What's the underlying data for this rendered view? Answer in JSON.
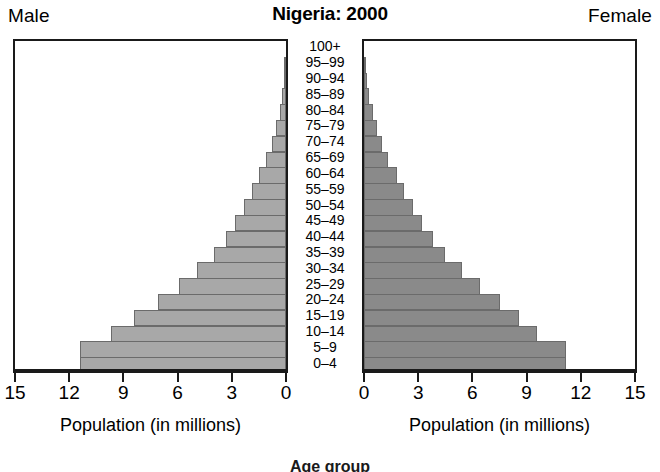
{
  "header": {
    "male_label": "Male",
    "female_label": "Female",
    "title": "Nigeria: 2000"
  },
  "footer": {
    "note": "Age group"
  },
  "axis": {
    "male_title": "Population (in millions)",
    "female_title": "Population (in millions)",
    "male_ticks": [
      "15",
      "12",
      "9",
      "6",
      "3",
      "0"
    ],
    "female_ticks": [
      "0",
      "3",
      "6",
      "9",
      "12",
      "15"
    ]
  },
  "colors": {
    "male_bar": "#a8a8a8",
    "female_bar": "#8a8a8a",
    "bar_border": "#6b6b6b",
    "frame": "#1a1a1a",
    "background": "#ffffff"
  },
  "chart_data": {
    "type": "bar",
    "subtype": "population-pyramid",
    "title": "Nigeria: 2000",
    "xlabel": "Population (in millions)",
    "ylabel": "Age group",
    "xlim": [
      0,
      15
    ],
    "xticks": [
      0,
      3,
      6,
      9,
      12,
      15
    ],
    "grid": false,
    "units": "millions",
    "categories": [
      "100+",
      "95–99",
      "90–94",
      "85–89",
      "80–84",
      "75–79",
      "70–74",
      "65–69",
      "60–64",
      "55–59",
      "50–54",
      "45–49",
      "40–44",
      "35–39",
      "30–34",
      "25–29",
      "20–24",
      "15–19",
      "10–14",
      "5–9",
      "0–4"
    ],
    "series": [
      {
        "name": "Male",
        "side": "left",
        "values": [
          0.0,
          0.05,
          0.1,
          0.2,
          0.35,
          0.55,
          0.8,
          1.1,
          1.5,
          1.9,
          2.35,
          2.8,
          3.3,
          4.0,
          4.9,
          5.9,
          7.1,
          8.4,
          9.7,
          11.4,
          11.4
        ]
      },
      {
        "name": "Female",
        "side": "right",
        "values": [
          0.0,
          0.05,
          0.15,
          0.3,
          0.5,
          0.7,
          1.0,
          1.35,
          1.8,
          2.2,
          2.7,
          3.2,
          3.8,
          4.5,
          5.4,
          6.4,
          7.5,
          8.6,
          9.6,
          11.2,
          11.2
        ]
      }
    ]
  }
}
